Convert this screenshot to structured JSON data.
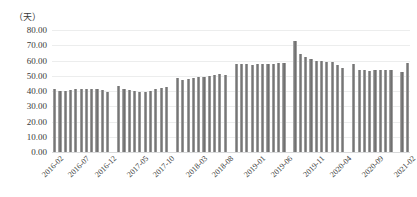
{
  "chart_data": {
    "type": "bar",
    "title": "",
    "subtitle": "",
    "xlabel": "",
    "ylabel": "（天）",
    "ylim": [
      0,
      80
    ],
    "ytick_step": 10,
    "ytick_labels": [
      "0.00",
      "10.00",
      "20.00",
      "30.00",
      "40.00",
      "50.00",
      "60.00",
      "70.00",
      "80.00"
    ],
    "grid": true,
    "legend": false,
    "bar_color": "#7d7d7d",
    "gridline_color": "#eceded",
    "axis_color": "#d9dadb",
    "text_color": "#3a3a3a",
    "xtick_interval_months": 5,
    "xtick_labels": [
      "2016-02",
      "2016-07",
      "2016-12",
      "2017-05",
      "2017-10",
      "2018-03",
      "2018-08",
      "2019-01",
      "2019-06",
      "2019-11",
      "2020-04",
      "2020-09",
      "2021-02",
      "2021-07",
      "2021-12"
    ],
    "categories": [
      "2016-02",
      "2016-03",
      "2016-04",
      "2016-05",
      "2016-06",
      "2016-07",
      "2016-08",
      "2016-09",
      "2016-10",
      "2016-11",
      "2016-12",
      "2017-03",
      "2017-04",
      "2017-05",
      "2017-06",
      "2017-07",
      "2017-08",
      "2017-09",
      "2017-10",
      "2017-11",
      "2017-12",
      "2018-03",
      "2018-04",
      "2018-05",
      "2018-06",
      "2018-07",
      "2018-08",
      "2018-09",
      "2018-10",
      "2018-11",
      "2018-12",
      "2019-03",
      "2019-04",
      "2019-05",
      "2019-06",
      "2019-07",
      "2019-08",
      "2019-09",
      "2019-10",
      "2019-11",
      "2019-12",
      "2020-03",
      "2020-04",
      "2020-05",
      "2020-06",
      "2020-07",
      "2020-08",
      "2020-09",
      "2020-10",
      "2020-11",
      "2020-12",
      "2021-03",
      "2021-04",
      "2021-05",
      "2021-06",
      "2021-07",
      "2021-08",
      "2021-09",
      "2021-10",
      "2021-11",
      "2021-12"
    ],
    "values": [
      41.0,
      40.0,
      40.0,
      40.5,
      41.0,
      41.0,
      41.0,
      41.5,
      41.0,
      40.5,
      39.5,
      43.5,
      41.0,
      40.5,
      40.0,
      39.5,
      39.5,
      40.0,
      41.0,
      42.0,
      42.5,
      48.5,
      47.0,
      48.0,
      48.5,
      49.0,
      49.0,
      50.0,
      50.5,
      51.0,
      50.5,
      58.0,
      57.5,
      57.5,
      57.0,
      57.5,
      57.5,
      58.0,
      58.0,
      58.5,
      58.5,
      73.0,
      64.5,
      62.0,
      61.0,
      59.5,
      59.5,
      59.0,
      59.0,
      57.0,
      55.0,
      57.5,
      54.0,
      54.0,
      53.0,
      53.5,
      53.5,
      53.5,
      53.5,
      52.5,
      58.5
    ],
    "group_gap_after_index": [
      10,
      20,
      30,
      40,
      50,
      58
    ]
  }
}
